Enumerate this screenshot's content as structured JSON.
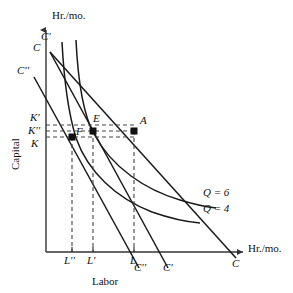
{
  "figure": {
    "type": "economics-isoquant-isocost-diagram",
    "axes": {
      "y_axis_top_label": "Hr./mo.",
      "x_axis_right_label": "Hr./mo.",
      "y_axis_name": "Capital",
      "x_axis_name": "Labor"
    },
    "capital_ticks": [
      {
        "id": "k-prime",
        "label": "K'",
        "x": 30,
        "y": 117
      },
      {
        "id": "k-double-prime",
        "label": "K''",
        "x": 28,
        "y": 130
      },
      {
        "id": "k",
        "label": "K",
        "x": 31,
        "y": 143
      }
    ],
    "labor_ticks": [
      {
        "id": "l-double-prime",
        "label": "L''",
        "x": 62,
        "y": 256
      },
      {
        "id": "l-prime",
        "label": "L'",
        "x": 88,
        "y": 256
      },
      {
        "id": "l",
        "label": "L",
        "x": 143,
        "y": 256
      }
    ],
    "points": [
      {
        "id": "point-f",
        "label": "F",
        "x": 72,
        "y": 136,
        "label_dx": 6,
        "label_dy": -9
      },
      {
        "id": "point-e",
        "label": "E",
        "x": 93,
        "y": 131,
        "label_dx": 2,
        "label_dy": -15
      },
      {
        "id": "point-a",
        "label": "A",
        "x": 134,
        "y": 131,
        "label_dx": 6,
        "label_dy": -13
      }
    ],
    "isocost_labels": [
      {
        "id": "isocost-c-prime-top",
        "label": "C'",
        "x": 41,
        "y": 36
      },
      {
        "id": "isocost-c-top",
        "label": "C",
        "x": 33,
        "y": 47
      },
      {
        "id": "isocost-c-double-prime-left",
        "label": "C''",
        "x": 17,
        "y": 70
      },
      {
        "id": "isocost-c-double-prime-bottom",
        "label": "C''",
        "x": 134,
        "y": 266
      },
      {
        "id": "isocost-c-prime-bottom",
        "label": "C'",
        "x": 163,
        "y": 266
      },
      {
        "id": "isocost-c-bottom",
        "label": "C",
        "x": 232,
        "y": 262
      }
    ],
    "isoquant_labels": [
      {
        "id": "isoquant-q6",
        "label": "Q = 6",
        "x": 205,
        "y": 193
      },
      {
        "id": "isoquant-q4",
        "label": "Q = 4",
        "x": 205,
        "y": 209
      }
    ],
    "colors": {
      "line": "#1a1a1a",
      "axis": "#333333",
      "dash": "#444444",
      "background": "#ffffff"
    }
  }
}
